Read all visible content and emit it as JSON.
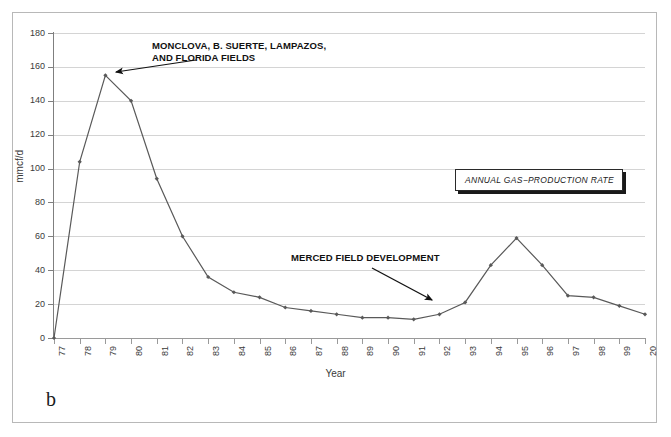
{
  "figure": {
    "panel_label": "b"
  },
  "chart_data": {
    "type": "line",
    "title": "",
    "xlabel": "Year",
    "ylabel": "mmcf/d",
    "ylim": [
      0,
      180
    ],
    "ytick_labels": [
      "0",
      "20",
      "40",
      "60",
      "80",
      "100",
      "120",
      "140",
      "160",
      "180"
    ],
    "ytick_values": [
      0,
      20,
      40,
      60,
      80,
      100,
      120,
      140,
      160,
      180
    ],
    "grid": true,
    "legend_position": "inside-right",
    "categories": [
      "77",
      "78",
      "79",
      "80",
      "81",
      "82",
      "83",
      "84",
      "85",
      "86",
      "87",
      "88",
      "89",
      "90",
      "91",
      "92",
      "93",
      "94",
      "95",
      "96",
      "97",
      "98",
      "99",
      "20"
    ],
    "series": [
      {
        "name": "ANNUAL GAS−PRODUCTION RATE",
        "values": [
          0,
          104,
          155,
          140,
          94,
          60,
          36,
          27,
          24,
          18,
          16,
          14,
          12,
          12,
          11,
          14,
          21,
          43,
          59,
          43,
          25,
          24,
          19,
          14
        ],
        "color": "#595959",
        "marker": "diamond"
      }
    ],
    "annotations": [
      {
        "id": "monclova",
        "text": "MONCLOVA, B. SUERTE, LAMPAZOS,\nAND FLORIDA FIELDS",
        "points_to_category": "79",
        "points_to_value": 155
      },
      {
        "id": "merced",
        "text": "MERCED FIELD DEVELOPMENT",
        "points_to_category": "93",
        "points_to_value": 21
      }
    ],
    "legend_label": "ANNUAL GAS−PRODUCTION RATE"
  }
}
